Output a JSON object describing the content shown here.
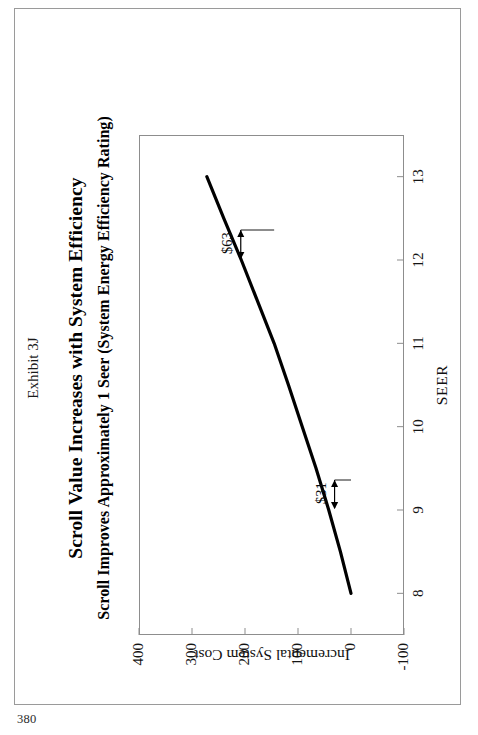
{
  "page": {
    "number": "380"
  },
  "exhibit": {
    "label": "Exhibit 3J"
  },
  "figure": {
    "title": "Scroll Value Increases with System Efficiency",
    "subtitle": "Scroll Improves Approximately 1 Seer (System Energy Efficiency Rating)"
  },
  "chart_data": {
    "type": "line",
    "title": "Scroll Value Increases with System Efficiency",
    "subtitle": "Scroll Improves Approximately 1 Seer (System Energy Efficiency Rating)",
    "xlabel": "SEER",
    "ylabel": "Incremental System Cost",
    "xlim": [
      7.5,
      13.5
    ],
    "ylim": [
      -100,
      400
    ],
    "xticks": [
      "8",
      "9",
      "10",
      "11",
      "12",
      "13"
    ],
    "xtick_values": [
      8,
      9,
      10,
      11,
      12,
      13
    ],
    "yticks": [
      "400",
      "300",
      "200",
      "100",
      "0",
      "-100"
    ],
    "ytick_values": [
      400,
      300,
      200,
      100,
      0,
      -100
    ],
    "grid": false,
    "legend": "none",
    "series": [
      {
        "name": "Incremental System Cost",
        "x": [
          8.0,
          8.5,
          9.0,
          9.5,
          10.0,
          10.5,
          11.0,
          11.5,
          12.0,
          12.5,
          13.0
        ],
        "values": [
          0,
          20,
          42,
          66,
          92,
          118,
          145,
          176,
          207,
          240,
          272
        ]
      }
    ],
    "annotations": [
      {
        "label": "$31",
        "x": 9.0,
        "y_from": 0,
        "y_to": 31,
        "note": "cost step at low SEER"
      },
      {
        "label": "$63",
        "x": 12.0,
        "y_from": 145,
        "y_to": 208,
        "note": "cost step at high SEER"
      }
    ],
    "line_color": "#000000"
  }
}
